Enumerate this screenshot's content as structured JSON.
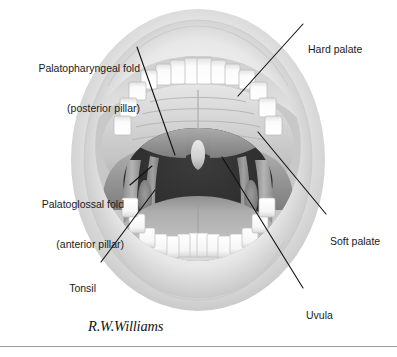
{
  "figure": {
    "signature": "R.W.Williams",
    "colors": {
      "background": "#ffffff",
      "leader_line": "#111111",
      "label_text": "#1a1a1a",
      "pharynx_dark": "#2e2e2e",
      "soft_palate": "#8d8d8d",
      "hard_palate": "#cfcfcf",
      "tongue": "#b4b4b4",
      "tooth_white": "#fafafa",
      "lip_outer": "#d9d9d9",
      "rule": "#9a9a9a"
    }
  },
  "labels": [
    {
      "id": "palatopharyngeal-fold",
      "lines": [
        "Palatopharyngeal fold",
        "(posterior pillar)"
      ],
      "line1": "Palatopharyngeal fold",
      "line2": "(posterior pillar)",
      "side": "left"
    },
    {
      "id": "hard-palate",
      "lines": [
        "Hard palate"
      ],
      "line1": "Hard palate",
      "side": "right"
    },
    {
      "id": "palatoglossal-fold",
      "lines": [
        "Palatoglossal fold",
        "(anterior pillar)"
      ],
      "line1": "Palatoglossal fold",
      "line2": "(anterior pillar)",
      "side": "left"
    },
    {
      "id": "soft-palate",
      "lines": [
        "Soft palate"
      ],
      "line1": "Soft palate",
      "side": "right"
    },
    {
      "id": "tonsil",
      "lines": [
        "Tonsil"
      ],
      "line1": "Tonsil",
      "side": "left"
    },
    {
      "id": "uvula",
      "lines": [
        "Uvula"
      ],
      "line1": "Uvula",
      "side": "right"
    }
  ],
  "anatomy_parts": [
    "upper-lip",
    "lower-lip",
    "upper-teeth",
    "lower-teeth",
    "hard-palate",
    "soft-palate",
    "uvula",
    "tonsil",
    "palatoglossal-fold",
    "palatopharyngeal-fold",
    "oropharynx",
    "tongue"
  ]
}
